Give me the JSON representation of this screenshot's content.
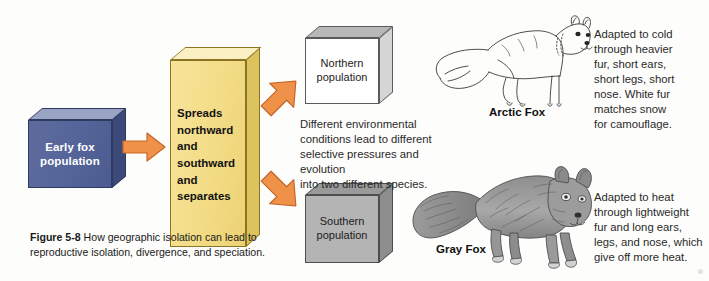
{
  "figure": {
    "caption_number": "Figure 5-8",
    "caption_text": " How geographic isolation can lead to reproductive isolation, divergence, and speciation."
  },
  "boxes": {
    "early": {
      "label": "Early fox population",
      "color": "#56659a"
    },
    "spreads": {
      "label": "Spreads\nnorthward\nand\nsouthward\nand\nseparates",
      "color": "#f3dc86"
    },
    "northern": {
      "label": "Northern\npopulation",
      "color": "#fefefe"
    },
    "southern": {
      "label": "Southern\npopulation",
      "color": "#b4b4b4"
    }
  },
  "arrows": {
    "main": "arrow-right-icon",
    "upper": "arrow-up-right-icon",
    "lower": "arrow-down-right-icon",
    "color": "#f0914a"
  },
  "text_blocks": {
    "middle": "Different environmental\nconditions lead to different\nselective pressures and evolution\ninto two different species.",
    "arctic": "Adapted to cold\nthrough heavier\nfur, short ears,\nshort legs, short\nnose. White fur\nmatches snow\nfor camouflage.",
    "gray": "Adapted to heat\nthrough lightweight\nfur and long ears,\nlegs, and nose, which\ngive off more heat."
  },
  "foxes": {
    "arctic": {
      "label": "Arctic Fox",
      "art": "arctic-fox-illustration"
    },
    "gray": {
      "label": "Gray Fox",
      "art": "gray-fox-illustration"
    }
  }
}
